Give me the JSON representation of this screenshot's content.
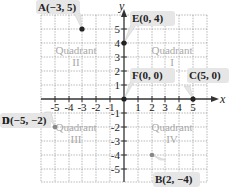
{
  "side_text": "n",
  "axes": {
    "x_label": "x",
    "y_label": "y",
    "x_ticks": [
      "-5",
      "-4",
      "-3",
      "-2",
      "-1",
      "1",
      "2",
      "3",
      "4",
      "5"
    ],
    "y_ticks": [
      "5",
      "4",
      "3",
      "2",
      "1",
      "-1",
      "-2",
      "-3",
      "-4",
      "-5"
    ]
  },
  "quadrants": [
    {
      "name": "Quadrant",
      "numeral": "I"
    },
    {
      "name": "Quadrant",
      "numeral": "II"
    },
    {
      "name": "Quadrant",
      "numeral": "III"
    },
    {
      "name": "Quadrant",
      "numeral": "IV"
    }
  ],
  "points": [
    {
      "label": "A(−3, 5)",
      "x": -3,
      "y": 5
    },
    {
      "label": "E(0, 4)",
      "x": 0,
      "y": 4
    },
    {
      "label": "F(0, 0)",
      "x": 0,
      "y": 0
    },
    {
      "label": "C(5, 0)",
      "x": 5,
      "y": 0
    },
    {
      "label": "D(−5, −2)",
      "x": -5,
      "y": -2
    },
    {
      "label": "B(2, −4)",
      "x": 2,
      "y": -4
    }
  ],
  "colors": {
    "grid": "#9a9a9a",
    "axis": "#333333",
    "label_bg": "#e6e6e6",
    "quadrant_text": "#a8a8a8",
    "point": "#222222"
  }
}
